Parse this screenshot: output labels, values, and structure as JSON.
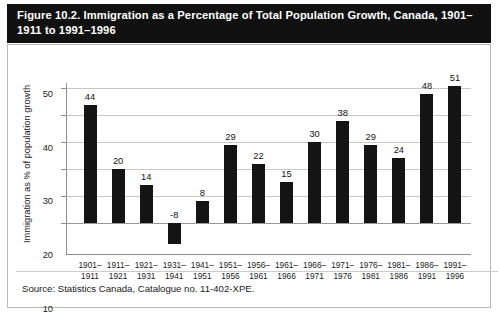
{
  "figure": {
    "title": "Figure 10.2. Immigration as a Percentage of Total Population Growth, Canada, 1901–1911 to 1991–1996",
    "source": "Source: Statistics Canada, Catalogue no. 11-402-XPE.",
    "banner_color": "#111111",
    "bar_color": "#141414",
    "grid_color": "#c8c8c8",
    "axis_color": "#8e8e8e"
  },
  "chart_data": {
    "type": "bar",
    "title": "Figure 10.2. Immigration as a Percentage of Total Population Growth, Canada, 1901–1911 to 1991–1996",
    "xlabel": "",
    "ylabel": "Immigration as % of population growth",
    "categories": [
      "1901–\n1911",
      "1911–\n1921",
      "1921–\n1931",
      "1931–\n1941",
      "1941–\n1951",
      "1951–\n1956",
      "1956–\n1961",
      "1961–\n1966",
      "1966–\n1971",
      "1971–\n1976",
      "1976–\n1981",
      "1981–\n1986",
      "1986–\n1991",
      "1991–\n1996"
    ],
    "categories_line1": [
      "1901–",
      "1911–",
      "1921–",
      "1931–",
      "1941–",
      "1951–",
      "1956–",
      "1961–",
      "1966–",
      "1971–",
      "1976–",
      "1981–",
      "1986–",
      "1991–"
    ],
    "categories_line2": [
      "1911",
      "1921",
      "1931",
      "1941",
      "1951",
      "1956",
      "1961",
      "1966",
      "1971",
      "1976",
      "1981",
      "1986",
      "1991",
      "1996"
    ],
    "values": [
      44,
      20,
      14,
      -8,
      8,
      29,
      22,
      15,
      30,
      38,
      29,
      24,
      48,
      51
    ],
    "value_labels": [
      "44",
      "20",
      "14",
      "-8",
      "8",
      "29",
      "22",
      "15",
      "30",
      "38",
      "29",
      "24",
      "48",
      "51"
    ],
    "ylim": [
      -12,
      52
    ],
    "yticks": [
      0,
      10,
      20,
      30,
      40,
      50
    ],
    "ytick_labels": [
      "0",
      "10",
      "20",
      "30",
      "40",
      "50"
    ],
    "grid": true,
    "legend": null,
    "legend_position": "none"
  }
}
